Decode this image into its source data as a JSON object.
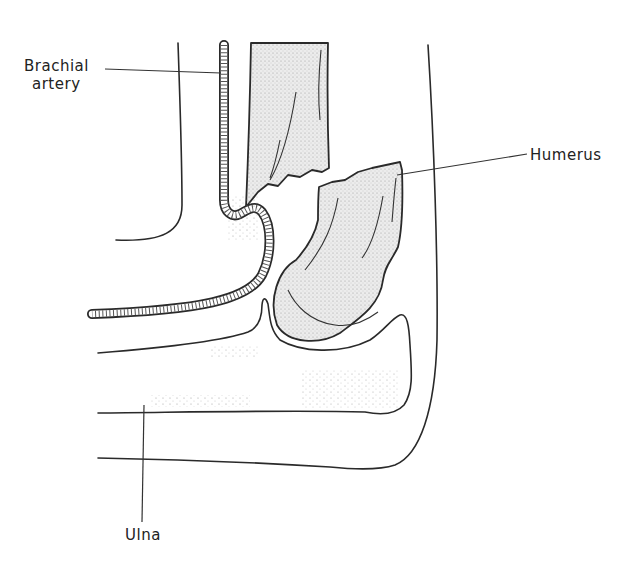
{
  "figure": {
    "type": "anatomical line drawing",
    "labels": [
      {
        "id": "brachial-artery",
        "text_line1": "Brachial",
        "text_line2": "artery"
      },
      {
        "id": "humerus",
        "text": "Humerus"
      },
      {
        "id": "ulna",
        "text": "Ulna"
      }
    ]
  },
  "colors": {
    "ink": "#2a2a2a",
    "bone_fill": "#e4e4e4",
    "background": "#ffffff"
  }
}
